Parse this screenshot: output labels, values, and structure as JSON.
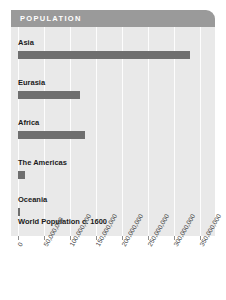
{
  "header": {
    "title": "POPULATION"
  },
  "colors": {
    "header_band": "#9a9a9a",
    "header_text": "#ffffff",
    "plot_background": "#e9e9e9",
    "bar": "#6e6e6e",
    "gridline": "#fdfdfd",
    "label_text": "#1b1b1b",
    "tick_text": "#3a3a3a",
    "page_background": "#ffffff"
  },
  "footnote": "World Population c. 1600",
  "chart_data": {
    "type": "bar",
    "orientation": "horizontal",
    "title": "POPULATION",
    "subtitle": "",
    "xlabel": "",
    "ylabel": "",
    "categories": [
      "Asia",
      "Eurasia",
      "Africa",
      "The Americas",
      "Oceania"
    ],
    "values": [
      330000000,
      120000000,
      128000000,
      14000000,
      4000000
    ],
    "series": [
      {
        "name": "World Population c. 1600",
        "values": [
          330000000,
          120000000,
          128000000,
          14000000,
          4000000
        ]
      }
    ],
    "xlim": [
      0,
      350000000
    ],
    "xticks": [
      0,
      50000000,
      100000000,
      150000000,
      200000000,
      250000000,
      300000000,
      350000000
    ],
    "xticklabels": [
      "0",
      "50,000,000",
      "100,000,000",
      "150,000,000",
      "200,000,000",
      "250,000,000",
      "300,000,000",
      "350,000,000"
    ],
    "grid": true,
    "grid_axis": "x",
    "legend": false,
    "legend_position": "none",
    "annotations": [
      "World Population c. 1600"
    ]
  }
}
